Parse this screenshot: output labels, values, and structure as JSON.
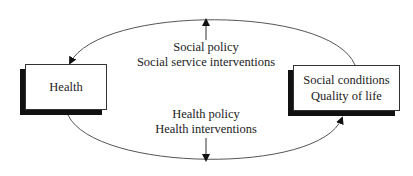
{
  "nodes": {
    "left": {
      "label": "Health"
    },
    "right": {
      "line1": "Social conditions",
      "line2": "Quality of life"
    }
  },
  "edges": {
    "top": {
      "line1": "Social policy",
      "line2": "Social service interventions",
      "direction": "up"
    },
    "bottom": {
      "line1": "Health policy",
      "line2": "Health interventions",
      "direction": "down"
    }
  },
  "colors": {
    "line": "#555555",
    "shadow": "#111111",
    "text": "#222222"
  }
}
